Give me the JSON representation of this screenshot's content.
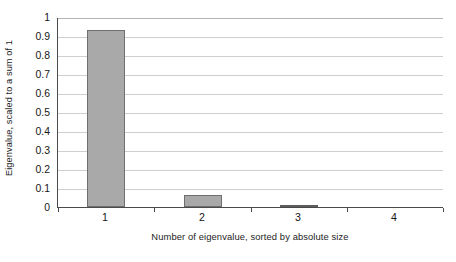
{
  "chart_data": {
    "type": "bar",
    "title": "",
    "xlabel": "Number of eigenvalue, sorted by absolute size",
    "ylabel": "Eigenvalue, scaled to a sum of 1",
    "categories": [
      "1",
      "2",
      "3",
      "4"
    ],
    "values": [
      0.93,
      0.065,
      0.005,
      0.0
    ],
    "ylim": [
      0,
      1
    ],
    "yticks": [
      "0",
      "0.1",
      "0.2",
      "0.3",
      "0.4",
      "0.5",
      "0.6",
      "0.7",
      "0.8",
      "0.9",
      "1"
    ],
    "ytick_values": [
      0,
      0.1,
      0.2,
      0.3,
      0.4,
      0.5,
      0.6,
      0.7,
      0.8,
      0.9,
      1
    ],
    "grid": true,
    "legend": false,
    "bar_fill_color": "#a9a9a9",
    "bar_border_color": "#6f6f6f",
    "gridline_color": "#cfcfcf",
    "axis_color": "#4a4a4a"
  }
}
